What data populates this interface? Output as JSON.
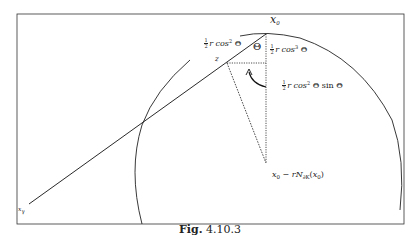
{
  "figure": {
    "caption_prefix": "Fig.",
    "caption_number": "4.10.3"
  },
  "labels": {
    "x0": {
      "base": "x",
      "sub": "0"
    },
    "x_gamma": {
      "base": "x",
      "sub": "γ"
    },
    "z": "z",
    "theta": "Θ",
    "left_segment": {
      "num": "1",
      "den": "2",
      "text": "r cos",
      "sup": "2",
      "tail": " Θ"
    },
    "vertical_segment": {
      "num": "1",
      "den": "2",
      "text": "r cos",
      "sup": "3",
      "tail": " Θ"
    },
    "horizontal_segment": {
      "num": "1",
      "den": "2",
      "text": "r cos",
      "sup": "2",
      "tail": " Θ sin Θ"
    },
    "center": {
      "a": "x",
      "a_sub": "0",
      "minus": " − ",
      "r": "r",
      "N": "N",
      "N_sub": "∂K",
      "open": "(",
      "b": "x",
      "b_sub": "0",
      "close": ")"
    }
  },
  "geometry": {
    "frame": {
      "x": 17,
      "y": 14,
      "w": 387,
      "h": 210
    },
    "x0_point": [
      266,
      34
    ],
    "x_gamma_point": [
      29,
      204
    ],
    "z_point": [
      227,
      63
    ],
    "center_point": [
      266,
      163
    ]
  }
}
